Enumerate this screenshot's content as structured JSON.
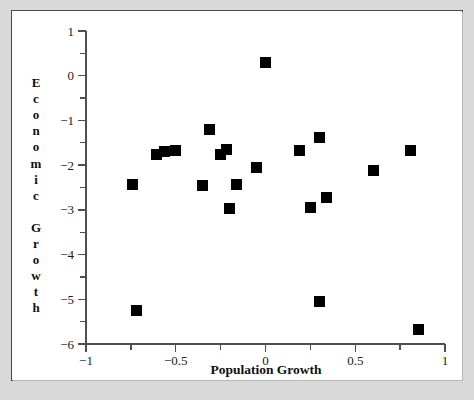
{
  "figure": {
    "background_color": "#d9d9d9",
    "plate_color": "#ffffff",
    "frame_color": "#4a4a4a",
    "marker_color": "#000000",
    "axis_color": "#4f4f4f"
  },
  "chart_data": {
    "type": "scatter",
    "title": "",
    "xlabel": "Population Growth",
    "ylabel": "Economic Growth",
    "xlim": [
      -1,
      1
    ],
    "ylim": [
      -6,
      1
    ],
    "grid": false,
    "legend": null,
    "x_major_ticks": [
      -1,
      -0.5,
      0,
      0.5,
      1
    ],
    "x_major_tick_labels": [
      "−1",
      "−0.5",
      "0",
      "0.5",
      "1"
    ],
    "x_minor_ticks": [
      -0.75,
      -0.25,
      0.25,
      0.75
    ],
    "y_major_ticks": [
      1,
      0,
      -1,
      -2,
      -3,
      -4,
      -5,
      -6
    ],
    "y_major_tick_labels": [
      "1",
      "0",
      "−1",
      "−2",
      "−3",
      "−4",
      "−5",
      "−6"
    ],
    "y_minor_ticks": [
      0.5,
      -0.5,
      -1.5,
      -2.5,
      -3.5,
      -4.5,
      -5.5
    ],
    "marker": "square",
    "marker_size_px": 11,
    "point_count": 21,
    "points": [
      {
        "x": -0.74,
        "y": -2.44
      },
      {
        "x": -0.72,
        "y": -5.24
      },
      {
        "x": -0.61,
        "y": -1.77
      },
      {
        "x": -0.56,
        "y": -1.7
      },
      {
        "x": -0.5,
        "y": -1.68
      },
      {
        "x": -0.35,
        "y": -2.45
      },
      {
        "x": -0.31,
        "y": -1.21
      },
      {
        "x": -0.25,
        "y": -1.76
      },
      {
        "x": -0.22,
        "y": -1.66
      },
      {
        "x": -0.2,
        "y": -2.98
      },
      {
        "x": -0.16,
        "y": -2.44
      },
      {
        "x": -0.05,
        "y": -2.06
      },
      {
        "x": 0.0,
        "y": 0.29
      },
      {
        "x": 0.19,
        "y": -1.68
      },
      {
        "x": 0.25,
        "y": -2.94
      },
      {
        "x": 0.3,
        "y": -1.38
      },
      {
        "x": 0.3,
        "y": -5.05
      },
      {
        "x": 0.34,
        "y": -2.73
      },
      {
        "x": 0.6,
        "y": -2.12
      },
      {
        "x": 0.81,
        "y": -1.68
      },
      {
        "x": 0.85,
        "y": -5.68
      }
    ]
  },
  "ylabel_letters": [
    "E",
    "c",
    "o",
    "n",
    "o",
    "m",
    "i",
    "c",
    "",
    "G",
    "r",
    "o",
    "w",
    "t",
    "h"
  ]
}
